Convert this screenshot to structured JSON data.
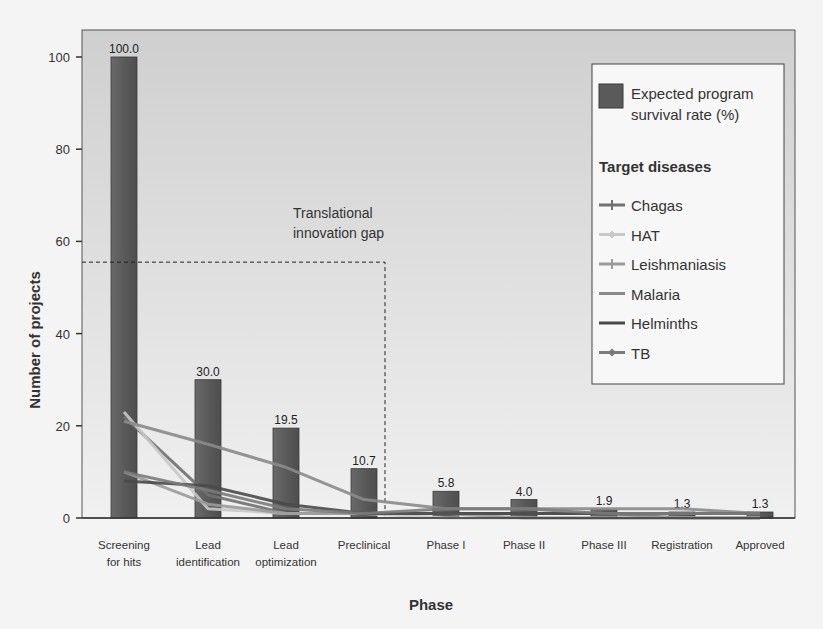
{
  "chart_data": {
    "type": "bar",
    "title": "",
    "xlabel": "Phase",
    "ylabel": "Number of projects",
    "ylim": [
      0,
      105
    ],
    "yticks": [
      0,
      20,
      40,
      60,
      80,
      100
    ],
    "grid": false,
    "legend_position": "upper right",
    "categories": [
      "Screening for hits",
      "Lead identification",
      "Lead optimization",
      "Preclinical",
      "Phase I",
      "Phase II",
      "Phase III",
      "Registration",
      "Approved"
    ],
    "category_label_lines": [
      [
        "Screening",
        "for hits"
      ],
      [
        "Lead",
        "identification"
      ],
      [
        "Lead",
        "optimization"
      ],
      [
        "Preclinical"
      ],
      [
        "Phase I"
      ],
      [
        "Phase II"
      ],
      [
        "Phase III"
      ],
      [
        "Registration"
      ],
      [
        "Approved"
      ]
    ],
    "bars": {
      "name": "Expected program survival rate (%)",
      "values": [
        100.0,
        30.0,
        19.5,
        10.7,
        5.8,
        4.0,
        1.9,
        1.3,
        1.3
      ],
      "labels": [
        "100.0",
        "30.0",
        "19.5",
        "10.7",
        "5.8",
        "4.0",
        "1.9",
        "1.3",
        "1.3"
      ],
      "color": "#5a5a5a"
    },
    "series": [
      {
        "name": "Chagas",
        "type": "line",
        "marker": "star",
        "color": "#707070",
        "values": [
          22,
          5,
          1,
          1,
          1,
          1,
          1,
          0,
          0
        ]
      },
      {
        "name": "HAT",
        "type": "line",
        "marker": "diamond",
        "color": "#c8c8c8",
        "values": [
          23,
          2,
          1,
          1,
          0,
          0,
          0,
          0,
          0
        ]
      },
      {
        "name": "Leishmaniasis",
        "type": "line",
        "marker": "plus",
        "color": "#9a9a9a",
        "values": [
          10,
          3,
          1,
          1,
          1,
          0,
          0,
          0,
          0
        ]
      },
      {
        "name": "Malaria",
        "type": "line",
        "marker": "none",
        "color": "#8a8a8a",
        "values": [
          21,
          16,
          11,
          4,
          2,
          2,
          2,
          2,
          1
        ]
      },
      {
        "name": "Helminths",
        "type": "line",
        "marker": "none",
        "color": "#4a4a4a",
        "values": [
          8,
          7,
          3,
          1,
          1,
          1,
          1,
          1,
          1
        ]
      },
      {
        "name": "TB",
        "type": "line",
        "marker": "diamond",
        "color": "#7a7a7a",
        "values": [
          10,
          6,
          2,
          1,
          2,
          2,
          1,
          1,
          1
        ]
      }
    ],
    "annotations": [
      {
        "text_lines": [
          "Translational",
          "innovation gap"
        ],
        "type": "dashed-bracket",
        "y": 55.5,
        "x_end_category": "Preclinical"
      }
    ],
    "legend": {
      "bar_entry_lines": [
        "Expected program",
        "survival rate (%)"
      ],
      "heading": "Target diseases",
      "entries": [
        "Chagas",
        "HAT",
        "Leishmaniasis",
        "Malaria",
        "Helminths",
        "TB"
      ]
    }
  },
  "colors": {
    "plot_background": "#d6d6d6",
    "page_background": "#f4f4f4",
    "bar": "#5a5a5a",
    "legend_background": "#f7f7f7"
  }
}
